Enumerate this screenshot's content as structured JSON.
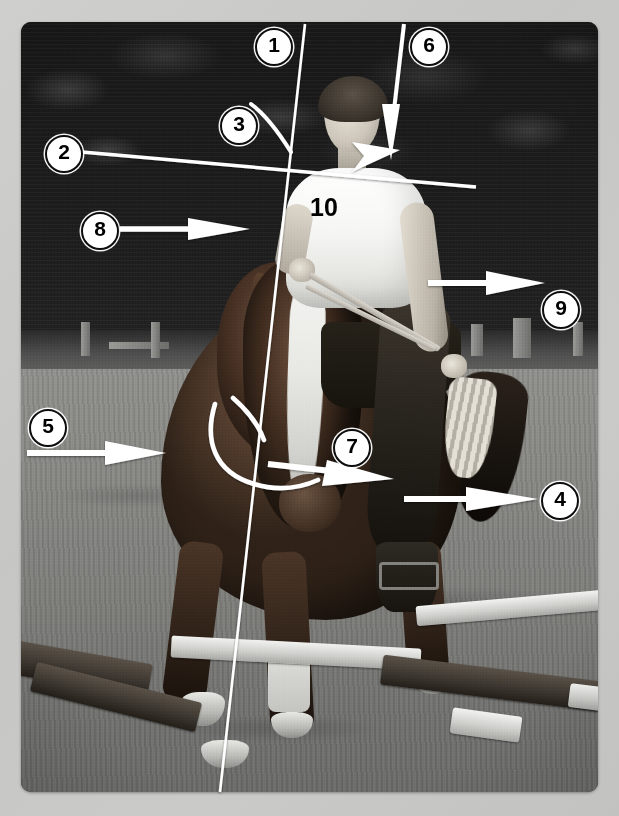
{
  "image": {
    "type": "annotated-photograph",
    "subject": "rider on horse with biomechanical alignment annotations",
    "palette": {
      "background": "#c8c8c6",
      "annotation_stroke": "#ffffff",
      "marker_fill": "#ffffff",
      "marker_text": "#000000",
      "marker_ring": "#0d0d0d"
    }
  },
  "annotations": {
    "shirt_number": "10",
    "markers": [
      {
        "id": "marker-1",
        "label": "1",
        "x": 272,
        "y": 45,
        "refers_to": "vertical-plumb-line"
      },
      {
        "id": "marker-2",
        "label": "2",
        "x": 62,
        "y": 152,
        "refers_to": "shoulder-horizontal-line"
      },
      {
        "id": "marker-3",
        "label": "3",
        "x": 237,
        "y": 124,
        "refers_to": "neck-curve-arc"
      },
      {
        "id": "marker-4",
        "label": "4",
        "x": 558,
        "y": 499,
        "refers_to": "hindquarter-arrow"
      },
      {
        "id": "marker-5",
        "label": "5",
        "x": 46,
        "y": 426,
        "refers_to": "shoulder-arrow"
      },
      {
        "id": "marker-6",
        "label": "6",
        "x": 427,
        "y": 45,
        "refers_to": "descending-arrow-to-shoulder"
      },
      {
        "id": "marker-7",
        "label": "7",
        "x": 350,
        "y": 446,
        "refers_to": "jaw-arrow"
      },
      {
        "id": "marker-8",
        "label": "8",
        "x": 98,
        "y": 229,
        "refers_to": "rein-hand-arrow"
      },
      {
        "id": "marker-9",
        "label": "9",
        "x": 559,
        "y": 308,
        "refers_to": "rider-arm-arrow"
      }
    ]
  },
  "geometry": {
    "photo": {
      "x": 21,
      "y": 22,
      "width": 577,
      "height": 770,
      "corner_radius": 10
    },
    "plumb_line": {
      "x1": 305,
      "y1": 24,
      "x2": 220,
      "y2": 792
    },
    "shoulder_line": {
      "x1": 82,
      "y1": 152,
      "x2": 475,
      "y2": 186
    },
    "arrows": [
      {
        "id": "arrow-5",
        "x1": 26,
        "y1": 453,
        "x2": 163,
        "y2": 453,
        "direction": "right"
      },
      {
        "id": "arrow-8",
        "x1": 120,
        "y1": 229,
        "x2": 248,
        "y2": 229,
        "direction": "right"
      },
      {
        "id": "arrow-9",
        "x1": 428,
        "y1": 283,
        "x2": 543,
        "y2": 283,
        "direction": "right"
      },
      {
        "id": "arrow-4",
        "x1": 404,
        "y1": 499,
        "x2": 537,
        "y2": 499,
        "direction": "right"
      },
      {
        "id": "arrow-7",
        "x1": 268,
        "y1": 466,
        "x2": 392,
        "y2": 478,
        "direction": "right"
      },
      {
        "id": "arrow-6",
        "x1": 404,
        "y1": 24,
        "x2": 390,
        "y2": 158,
        "direction": "down"
      }
    ],
    "arcs": [
      {
        "id": "arc-3",
        "description": "neck crest arc"
      },
      {
        "id": "arc-7-outer",
        "description": "outer jaw/cheek arc"
      },
      {
        "id": "arc-7-inner",
        "description": "inner jaw arc"
      }
    ]
  }
}
